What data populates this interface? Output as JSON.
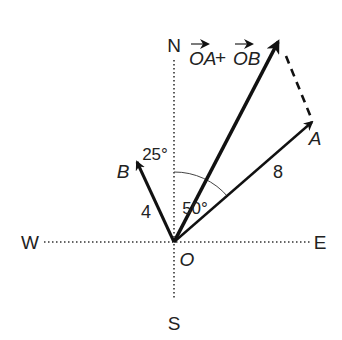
{
  "compass": {
    "north": "N",
    "south": "S",
    "east": "E",
    "west": "W"
  },
  "origin_label": "O",
  "vectors": {
    "a": {
      "label": "A",
      "magnitude": "8",
      "angle_label": "50°"
    },
    "b": {
      "label": "B",
      "magnitude": "4",
      "angle_label": "25°"
    },
    "sum": {
      "label_part1": "OA",
      "plus": "+",
      "label_part2": "OB"
    }
  },
  "colors": {
    "stroke": "#111111",
    "text": "#222222"
  }
}
